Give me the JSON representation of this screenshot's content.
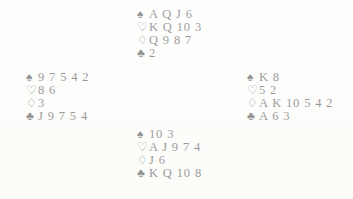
{
  "document": {
    "type": "bridge-deal-diagram",
    "background_color": "#fdfdfb",
    "ink_color": "#1b1b1b"
  },
  "suits": {
    "spade": {
      "name": "spade-suit-symbol",
      "glyph": "♠",
      "fill": "solid"
    },
    "heart": {
      "name": "heart-suit-symbol",
      "glyph": "♡",
      "fill": "hollow"
    },
    "diamond": {
      "name": "diamond-suit-symbol",
      "glyph": "♢",
      "fill": "hollow"
    },
    "club": {
      "name": "club-suit-symbol",
      "glyph": "♣",
      "fill": "solid"
    }
  },
  "hands": {
    "north": {
      "position": "North",
      "spades": "A Q J 6",
      "hearts": "K Q 10 3",
      "diamonds": "Q 9 8 7",
      "clubs": "2"
    },
    "west": {
      "position": "West",
      "spades": "9 7 5 4 2",
      "hearts": "8 6",
      "diamonds": "3",
      "clubs": "J 9 7 5 4"
    },
    "east": {
      "position": "East",
      "spades": "K 8",
      "hearts": "5 2",
      "diamonds": "A K 10 5 4 2",
      "clubs": "A 6 3"
    },
    "south": {
      "position": "South",
      "spades": "10 3",
      "hearts": "A J 9 7 4",
      "diamonds": "J 6",
      "clubs": "K Q 10 8"
    }
  }
}
